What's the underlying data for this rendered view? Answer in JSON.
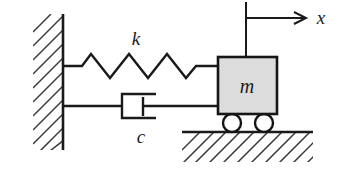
{
  "figure": {
    "type": "mechanical-schematic",
    "background_color": "#ffffff",
    "line_color": "#1a1a1a",
    "hatch_color": "#3a3a3a",
    "mass_fill_color": "#dcdcdc"
  },
  "labels": {
    "spring_stiffness": "k",
    "damping_coefficient": "c",
    "mass": "m",
    "displacement_axis": "x"
  },
  "components": {
    "wall": {
      "name": "fixed-wall",
      "face_x": 63,
      "top_y": 14,
      "bottom_y": 150,
      "hatch_width": 30
    },
    "spring": {
      "name": "coil-spring",
      "coils": 4,
      "start_x": 63,
      "end_x": 218,
      "baseline_y": 66,
      "amplitude": 12
    },
    "damper": {
      "name": "dashpot-damper",
      "cylinder_left_x": 122,
      "cylinder_right_x": 156,
      "cylinder_top_y": 94,
      "cylinder_bottom_y": 118,
      "piston_x": 143,
      "rod_y": 106,
      "rod_end_x": 218
    },
    "mass_block": {
      "name": "mass-block",
      "left_x": 218,
      "top_y": 57,
      "width": 59,
      "height": 57
    },
    "wheels": {
      "name": "roller-wheels",
      "count": 2,
      "radius": 9,
      "center_y": 123,
      "centers_x": [
        232,
        264
      ]
    },
    "ground": {
      "name": "ground-surface",
      "line_y": 132,
      "start_x": 182,
      "end_x": 313,
      "hatch_depth": 30
    },
    "axis": {
      "name": "displacement-axis",
      "vertical_x": 246,
      "vertical_top_y": 2,
      "vertical_bottom_y": 57,
      "arrow_y": 18,
      "arrow_start_x": 246,
      "arrow_tip_x": 306,
      "label_x": 320,
      "label_y": 20
    }
  }
}
